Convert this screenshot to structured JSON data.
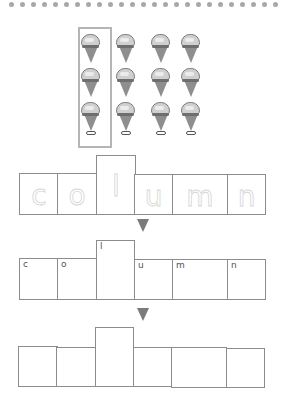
{
  "header": {
    "decoration": "dotted-border",
    "dot_count": 25,
    "dot_color": "#a8a8a8"
  },
  "illustration": {
    "subject": "ice-cream-cones",
    "columns": 4,
    "rows": 3,
    "highlighted_column": 1,
    "highlight_color": "#b5b5b5"
  },
  "word_rows": [
    {
      "type": "traced",
      "letters": [
        "c",
        "o",
        "l",
        "u",
        "m",
        "n"
      ]
    },
    {
      "type": "labeled",
      "letters": [
        "c",
        "o",
        "l",
        "u",
        "m",
        "n"
      ]
    },
    {
      "type": "blank",
      "letters": [
        "",
        "",
        "",
        "",
        "",
        ""
      ]
    }
  ],
  "arrows": [
    {
      "icon": "down-triangle-icon"
    },
    {
      "icon": "down-triangle-icon"
    }
  ],
  "word": "column",
  "colors": {
    "box_border": "#8c8c8c",
    "arrow": "#7b7b7b",
    "traced_letter": "#d6d6d6"
  }
}
